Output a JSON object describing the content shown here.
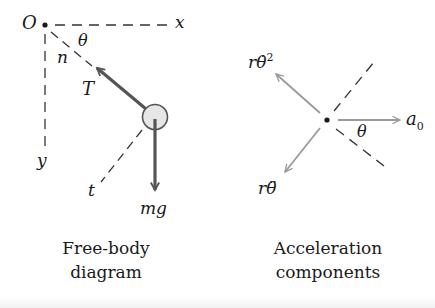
{
  "figure": {
    "panels": [
      {
        "id": "free-body",
        "caption_line1": "Free-body",
        "caption_line2": "diagram",
        "labels": {
          "origin": "O",
          "x_axis": "x",
          "y_axis": "y",
          "angle": "θ",
          "normal": "n",
          "tension": "T",
          "tangent": "t",
          "weight": "mg"
        }
      },
      {
        "id": "acceleration",
        "caption_line1": "Acceleration",
        "caption_line2": "components",
        "labels": {
          "centripetal_base": "r",
          "centripetal_theta": "θ̇",
          "centripetal_exp": "2",
          "tangential_base": "r",
          "tangential_theta": "θ̈",
          "frame_accel_base": "a",
          "frame_accel_sub": "0",
          "angle": "θ"
        }
      }
    ],
    "colors": {
      "ink": "#1a1a1a",
      "force_arrow": "#555555",
      "accel_arrow": "#9a9a9a",
      "bob_fill": "#e6e6e6",
      "dashed": "#333333"
    }
  }
}
